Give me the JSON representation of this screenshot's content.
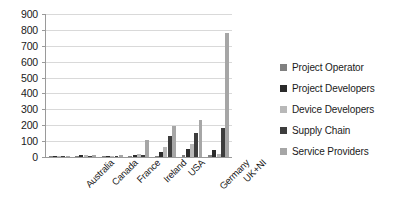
{
  "chart_data": {
    "type": "bar",
    "title": "",
    "xlabel": "",
    "ylabel": "",
    "ylim": [
      0,
      900
    ],
    "ytick_step": 100,
    "yticks": [
      900,
      800,
      700,
      600,
      500,
      400,
      300,
      200,
      100,
      0
    ],
    "grid": true,
    "legend_position": "right",
    "categories": [
      "Australia",
      "Canada",
      "France",
      "Ireland",
      "USA",
      "Germany",
      "UK+NI"
    ],
    "series": [
      {
        "name": "Project Operator",
        "color": "#808080",
        "values": [
          2,
          4,
          3,
          6,
          8,
          10,
          12
        ]
      },
      {
        "name": "Project Developers",
        "color": "#2b2b2b",
        "values": [
          3,
          10,
          8,
          14,
          30,
          48,
          45
        ]
      },
      {
        "name": "Device Developers",
        "color": "#b8b8b8",
        "values": [
          4,
          12,
          6,
          18,
          60,
          85,
          22
        ]
      },
      {
        "name": "Supply Chain",
        "color": "#3d3d3d",
        "values": [
          3,
          8,
          5,
          12,
          130,
          150,
          185
        ]
      },
      {
        "name": "Service Providers",
        "color": "#a6a6a6",
        "values": [
          5,
          14,
          10,
          110,
          195,
          230,
          780
        ]
      }
    ]
  },
  "legend": {
    "items": [
      {
        "label": "Project Operator",
        "color": "#808080"
      },
      {
        "label": "Project Developers",
        "color": "#2b2b2b"
      },
      {
        "label": "Device Developers",
        "color": "#b8b8b8"
      },
      {
        "label": "Supply Chain",
        "color": "#3d3d3d"
      },
      {
        "label": "Service Providers",
        "color": "#a6a6a6"
      }
    ]
  }
}
